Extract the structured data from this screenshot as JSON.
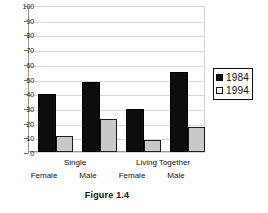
{
  "chart_data": {
    "type": "bar",
    "title": "",
    "caption": "Figure 1.4",
    "xlabel": "",
    "ylabel": "",
    "ylim": [
      0,
      100
    ],
    "yticks": [
      0,
      10,
      20,
      30,
      40,
      50,
      60,
      70,
      80,
      90,
      100
    ],
    "grid": true,
    "legend_position": "right",
    "group_labels": [
      "Single",
      "Living Together"
    ],
    "categories": [
      "Female",
      "Male",
      "Female",
      "Male"
    ],
    "series": [
      {
        "name": "1984",
        "color": "#0d0d0d",
        "values": [
          40,
          48,
          30,
          55
        ]
      },
      {
        "name": "1994",
        "color": "#c9c9c9",
        "values": [
          11,
          23,
          8,
          17
        ]
      }
    ]
  },
  "legend": {
    "items": [
      {
        "label": "1984",
        "swatch": "filled-square-icon"
      },
      {
        "label": "1994",
        "swatch": "hollow-square-icon"
      }
    ]
  },
  "axis": {
    "y_tick_labels": [
      "100",
      "90",
      "80",
      "70",
      "60",
      "50",
      "40",
      "30",
      "20",
      "10",
      "0"
    ]
  },
  "labels": {
    "group_single": "Single",
    "group_living_together": "Living Together",
    "cat_1": "Female",
    "cat_2": "Male",
    "cat_3": "Female",
    "cat_4": "Male"
  },
  "caption": {
    "text": "Figure 1.4"
  }
}
